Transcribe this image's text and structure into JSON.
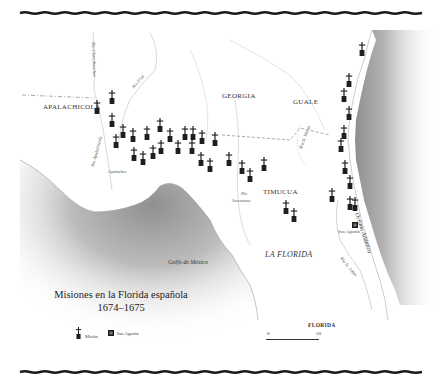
{
  "title": {
    "line1": "Misiones en la Florida española",
    "line2": "1674–1675"
  },
  "regions": {
    "apalachicola": "APALACHICOLA",
    "georgia": "GEORGIA",
    "guale": "GUALE",
    "timucua": "TIMUCUA",
    "la_florida": "LA FLORIDA",
    "florida": "FLORIDA"
  },
  "water": {
    "gulf": "Golfo de México",
    "atlantic": "Océano Atlántico"
  },
  "rivers": {
    "chattahoochee": "Río Chattahoochee",
    "flint": "Río Flint",
    "apalachicola": "Río Apalachicola",
    "suwannee_1": "Río",
    "suwannee_2": "Suwannee",
    "st_marys": "Río St. Marys",
    "st_johns": "Río St. Johns"
  },
  "places": {
    "apalachee": "Apalachee",
    "san_agustin": "San Agustín"
  },
  "legend": {
    "mission": "Misión",
    "san_agustin": "San Agustín"
  },
  "scale": {
    "start": "0",
    "end": "50"
  },
  "colors": {
    "ink": "#1e1e1e",
    "water": "#9a9a9a",
    "river": "#c8c8c8",
    "border": "#1a1a1a"
  },
  "missions": [
    {
      "x": 97,
      "y": 100
    },
    {
      "x": 112,
      "y": 90
    },
    {
      "x": 112,
      "y": 113
    },
    {
      "x": 123,
      "y": 124
    },
    {
      "x": 116,
      "y": 134
    },
    {
      "x": 133,
      "y": 128
    },
    {
      "x": 134,
      "y": 147
    },
    {
      "x": 143,
      "y": 151
    },
    {
      "x": 147,
      "y": 126
    },
    {
      "x": 153,
      "y": 145
    },
    {
      "x": 160,
      "y": 118
    },
    {
      "x": 161,
      "y": 140
    },
    {
      "x": 170,
      "y": 128
    },
    {
      "x": 178,
      "y": 140
    },
    {
      "x": 185,
      "y": 126
    },
    {
      "x": 192,
      "y": 140
    },
    {
      "x": 201,
      "y": 152
    },
    {
      "x": 193,
      "y": 126
    },
    {
      "x": 202,
      "y": 130
    },
    {
      "x": 210,
      "y": 158
    },
    {
      "x": 215,
      "y": 132
    },
    {
      "x": 229,
      "y": 152
    },
    {
      "x": 242,
      "y": 160
    },
    {
      "x": 250,
      "y": 168
    },
    {
      "x": 264,
      "y": 157
    },
    {
      "x": 286,
      "y": 200
    },
    {
      "x": 294,
      "y": 208
    },
    {
      "x": 362,
      "y": 42
    },
    {
      "x": 349,
      "y": 73
    },
    {
      "x": 344,
      "y": 88
    },
    {
      "x": 349,
      "y": 106
    },
    {
      "x": 344,
      "y": 125
    },
    {
      "x": 341,
      "y": 138
    },
    {
      "x": 345,
      "y": 160
    },
    {
      "x": 350,
      "y": 175
    },
    {
      "x": 332,
      "y": 188
    },
    {
      "x": 350,
      "y": 196
    },
    {
      "x": 355,
      "y": 197
    }
  ]
}
